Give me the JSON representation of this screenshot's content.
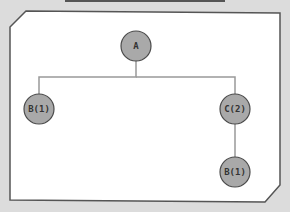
{
  "diagram": {
    "type": "tree",
    "colors": {
      "background": "#dcdcdc",
      "panel": "#ffffff",
      "panel_border": "#555555",
      "edge": "#999999",
      "node_fill": "#a9a9a9",
      "node_stroke": "#4a4a4a",
      "label": "#333333"
    },
    "nodes": [
      {
        "id": "a",
        "label": "A",
        "x": 136,
        "y": 46
      },
      {
        "id": "b1",
        "label": "B(1)",
        "x": 39,
        "y": 109
      },
      {
        "id": "c2",
        "label": "C(2)",
        "x": 235,
        "y": 109
      },
      {
        "id": "b1c",
        "label": "B(1)",
        "x": 235,
        "y": 172
      }
    ],
    "edges": [
      {
        "from": "a",
        "to": "b1"
      },
      {
        "from": "a",
        "to": "c2"
      },
      {
        "from": "c2",
        "to": "b1c"
      }
    ]
  }
}
